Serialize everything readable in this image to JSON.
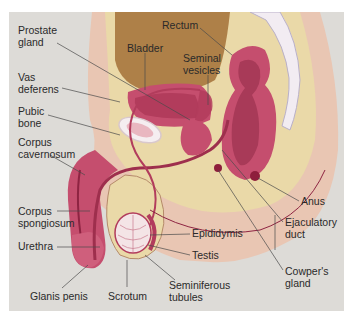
{
  "diagram": {
    "labels": [
      {
        "id": "prostate-gland",
        "text": "Prostate\ngland",
        "x": 18,
        "y": 25
      },
      {
        "id": "bladder",
        "text": "Bladder",
        "x": 127,
        "y": 43
      },
      {
        "id": "rectum",
        "text": "Rectum",
        "x": 162,
        "y": 20
      },
      {
        "id": "seminal-vesicles",
        "text": "Seminal\nvesicles",
        "x": 183,
        "y": 53
      },
      {
        "id": "vas-deferens",
        "text": "Vas\ndeferens",
        "x": 18,
        "y": 72
      },
      {
        "id": "pubic-bone",
        "text": "Pubic\nbone",
        "x": 18,
        "y": 106
      },
      {
        "id": "corpus-cavernosum",
        "text": "Corpus\ncavernosum",
        "x": 18,
        "y": 137
      },
      {
        "id": "corpus-spongiosum",
        "text": "Corpus\nspongiosum",
        "x": 18,
        "y": 206
      },
      {
        "id": "urethra",
        "text": "Urethra",
        "x": 18,
        "y": 241
      },
      {
        "id": "glanis-penis",
        "text": "Glanis penis",
        "x": 30,
        "y": 291
      },
      {
        "id": "scrotum",
        "text": "Scrotum",
        "x": 108,
        "y": 291
      },
      {
        "id": "seminiferous-tubules",
        "text": "Seminiferous\ntubules",
        "x": 169,
        "y": 280
      },
      {
        "id": "epididymis",
        "text": "Epididymis",
        "x": 192,
        "y": 228
      },
      {
        "id": "testis",
        "text": "Testis",
        "x": 192,
        "y": 250
      },
      {
        "id": "anus",
        "text": "Anus",
        "x": 301,
        "y": 196
      },
      {
        "id": "ejaculatory-duct",
        "text": "Ejaculatory\nduct",
        "x": 285,
        "y": 217
      },
      {
        "id": "cowpers-gland",
        "text": "Cowper's\ngland",
        "x": 285,
        "y": 266
      }
    ]
  },
  "colors": {
    "background": "#dddbd7",
    "skin": "#e8b3a8",
    "tissue_pink": "#c54e6e",
    "tissue_dark": "#9e2f4d",
    "fat_yellow": "#ead9a8",
    "bladder_brown": "#a7753d",
    "bone_white": "#f5eef0",
    "leader_line": "#4a4a4a"
  }
}
